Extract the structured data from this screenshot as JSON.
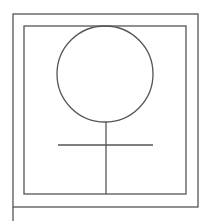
{
  "diagram": {
    "symbol": "female-venus-symbol",
    "stroke_color": "#555555",
    "background": "#ffffff",
    "outer_frame": {
      "x": 13,
      "y": 14,
      "w": 185,
      "h": 193
    },
    "inner_frame": {
      "x": 24,
      "y": 26,
      "w": 162,
      "h": 168
    },
    "circle": {
      "cx": 105,
      "cy": 74,
      "r": 48
    },
    "stem": {
      "x": 106,
      "y1": 122,
      "y2": 194
    },
    "crossbar": {
      "y": 145,
      "x1": 58,
      "x2": 153
    }
  }
}
